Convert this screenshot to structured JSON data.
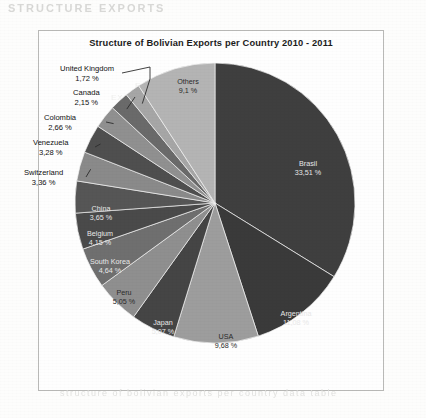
{
  "page": {
    "ghost_text_top": "STRUCTURE EXPORTS",
    "ghost_text_bottom": "structure of bolivian exports per country data table",
    "ghost_text_inner_1": "ESTRUCTURA DE LAS",
    "ghost_text_inner_2": "EXPORTACIONES BOLIVIANAS"
  },
  "chart_frame": {
    "title": "Structure of Bolivian Exports per Country   2010 - 2011"
  },
  "chart_data": {
    "type": "pie",
    "title": "Structure of Bolivian Exports per Country   2010 - 2011",
    "xlabel": "",
    "ylabel": "",
    "legend_position": "none",
    "grid": false,
    "value_unit": "%",
    "decimal_separator": ",",
    "start_angle_deg": 0,
    "direction": "clockwise",
    "categories": [
      "Brasil",
      "Argentina",
      "USA",
      "Japan",
      "Peru",
      "South Korea",
      "Belgium",
      "China",
      "Switzerland",
      "Venezuela",
      "Colombia",
      "Canada",
      "United Kingdom",
      "Others"
    ],
    "values": [
      33.51,
      11.08,
      9.68,
      5.07,
      5.05,
      4.64,
      4.15,
      3.65,
      3.36,
      3.28,
      2.66,
      2.15,
      1.72,
      9.1
    ],
    "slices": [
      {
        "label": "Brasil",
        "value": 33.51,
        "value_text": "33,51 %",
        "color": "#3f3f3f",
        "label_placement": "inside",
        "text_tone": "on-dark"
      },
      {
        "label": "Argentina",
        "value": 11.08,
        "value_text": "11,08 %",
        "color": "#3a3a3a",
        "label_placement": "inside",
        "text_tone": "on-dark"
      },
      {
        "label": "USA",
        "value": 9.68,
        "value_text": "9,68 %",
        "color": "#9d9d9d",
        "label_placement": "inside",
        "text_tone": "on-light"
      },
      {
        "label": "Japan",
        "value": 5.07,
        "value_text": "5,07 %",
        "color": "#454545",
        "label_placement": "inside",
        "text_tone": "on-dark"
      },
      {
        "label": "Peru",
        "value": 5.05,
        "value_text": "5,05 %",
        "color": "#8f8f8f",
        "label_placement": "inside",
        "text_tone": "on-light"
      },
      {
        "label": "South Korea",
        "value": 4.64,
        "value_text": "4,64 %",
        "color": "#6f6f6f",
        "label_placement": "inside",
        "text_tone": "on-dark"
      },
      {
        "label": "Belgium",
        "value": 4.15,
        "value_text": "4,15 %",
        "color": "#4a4a4a",
        "label_placement": "inside",
        "text_tone": "on-dark"
      },
      {
        "label": "China",
        "value": 3.65,
        "value_text": "3,65 %",
        "color": "#565656",
        "label_placement": "inside",
        "text_tone": "on-dark"
      },
      {
        "label": "Switzerland",
        "value": 3.36,
        "value_text": "3,36 %",
        "color": "#8a8a8a",
        "label_placement": "outside",
        "text_tone": "on-light"
      },
      {
        "label": "Venezuela",
        "value": 3.28,
        "value_text": "3,28 %",
        "color": "#4f4f4f",
        "label_placement": "outside",
        "text_tone": "on-dark"
      },
      {
        "label": "Colombia",
        "value": 2.66,
        "value_text": "2,66 %",
        "color": "#909090",
        "label_placement": "outside",
        "text_tone": "on-light"
      },
      {
        "label": "Canada",
        "value": 2.15,
        "value_text": "2,15 %",
        "color": "#6a6a6a",
        "label_placement": "outside",
        "text_tone": "on-dark"
      },
      {
        "label": "United Kingdom",
        "value": 1.72,
        "value_text": "1,72 %",
        "color": "#a6a6a6",
        "label_placement": "outside",
        "text_tone": "on-light"
      },
      {
        "label": "Others",
        "value": 9.1,
        "value_text": "9,1 %",
        "color": "#b4b4b4",
        "label_placement": "inside",
        "text_tone": "on-light"
      }
    ]
  }
}
